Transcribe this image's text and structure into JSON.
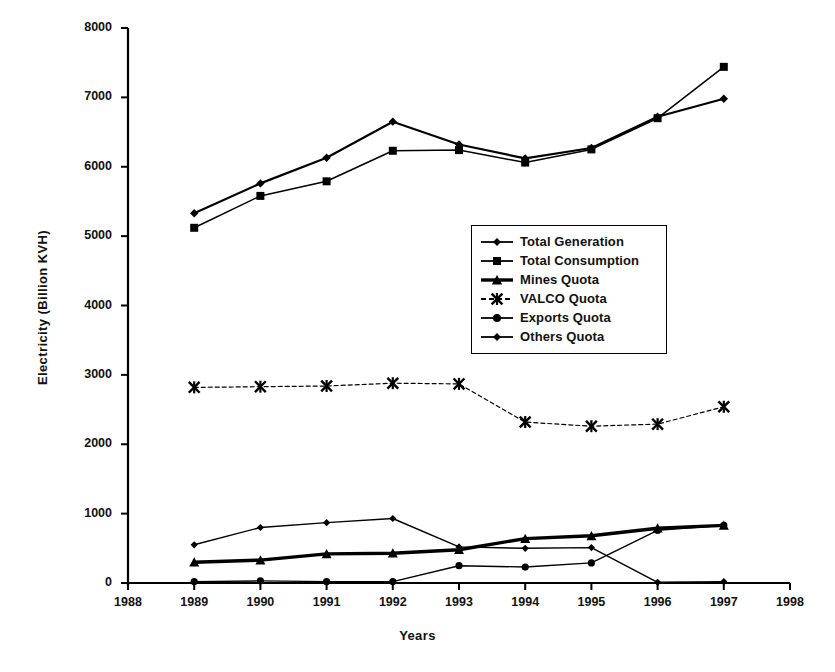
{
  "chart_data": {
    "type": "line",
    "title": "",
    "xlabel": "Years",
    "ylabel": "Electricity (Billion KVH)",
    "xlim": [
      1988,
      1998
    ],
    "ylim": [
      0,
      8000
    ],
    "xticks": [
      "1988",
      "1989",
      "1990",
      "1991",
      "1992",
      "1993",
      "1994",
      "1995",
      "1996",
      "1997",
      "1998"
    ],
    "yticks": [
      "0",
      "1000",
      "2000",
      "3000",
      "4000",
      "5000",
      "6000",
      "7000",
      "8000"
    ],
    "grid": false,
    "legend_position": "center-right",
    "x": [
      1989,
      1990,
      1991,
      1992,
      1993,
      1994,
      1995,
      1996,
      1997
    ],
    "series": [
      {
        "name": "Total Generation",
        "marker": "diamond",
        "values": [
          5330,
          5760,
          6130,
          6650,
          6320,
          6120,
          6270,
          6720,
          6980
        ]
      },
      {
        "name": "Total Consumption",
        "marker": "square",
        "values": [
          5120,
          5580,
          5790,
          6230,
          6240,
          6060,
          6250,
          6700,
          7440
        ]
      },
      {
        "name": "Mines Quota",
        "marker": "triangle",
        "values": [
          300,
          330,
          420,
          430,
          480,
          640,
          680,
          790,
          830
        ]
      },
      {
        "name": "VALCO Quota",
        "marker": "star",
        "values": [
          2820,
          2830,
          2840,
          2880,
          2870,
          2320,
          2260,
          2290,
          2540
        ]
      },
      {
        "name": "Exports Quota",
        "marker": "circle",
        "values": [
          20,
          30,
          20,
          20,
          250,
          230,
          290,
          760,
          830
        ]
      },
      {
        "name": "Others Quota",
        "marker": "diamond",
        "values": [
          550,
          800,
          870,
          930,
          520,
          500,
          510,
          10,
          20
        ]
      }
    ]
  },
  "legend": {
    "items": [
      {
        "label": "Total Generation",
        "marker": "diamond"
      },
      {
        "label": "Total Consumption",
        "marker": "square"
      },
      {
        "label": "Mines Quota",
        "marker": "triangle"
      },
      {
        "label": "VALCO Quota",
        "marker": "star"
      },
      {
        "label": "Exports Quota",
        "marker": "circle"
      },
      {
        "label": "Others Quota",
        "marker": "diamond"
      }
    ]
  }
}
